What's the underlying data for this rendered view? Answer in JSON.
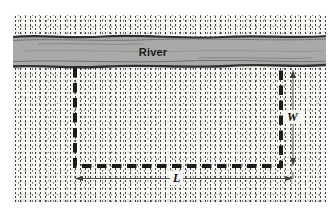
{
  "figure": {
    "labels": {
      "river": "River",
      "width": "W",
      "length": "L"
    },
    "colors": {
      "page_bg": "#ffffff",
      "ground_bg": "#fbfbf8",
      "river_fill": "#a9a9a9",
      "river_edge": "#2f2f2f",
      "fence_dash": "#1b1b1b",
      "dimension_line": "#4f4f4f",
      "label_text": "#131313",
      "label_patch": "#f6f6f2"
    }
  }
}
